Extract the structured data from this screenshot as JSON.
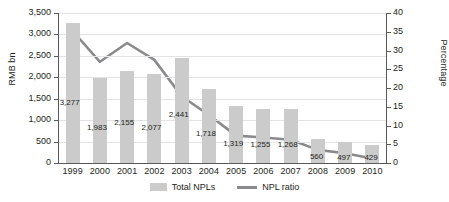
{
  "chart_data": {
    "type": "bar",
    "title": "",
    "categories": [
      "1999",
      "2000",
      "2001",
      "2002",
      "2003",
      "2004",
      "2005",
      "2006",
      "2007",
      "2008",
      "2009",
      "2010"
    ],
    "xlabel": "",
    "ylabel": "RMB bn",
    "ylabel_secondary": "Percentage",
    "ylim": [
      0,
      3500
    ],
    "ylim_secondary": [
      0,
      40
    ],
    "yticks": [
      "0",
      "500",
      "1,000",
      "1,500",
      "2,000",
      "2,500",
      "3,000",
      "3,500"
    ],
    "ytick_values": [
      0,
      500,
      1000,
      1500,
      2000,
      2500,
      3000,
      3500
    ],
    "yticks_secondary": [
      "0",
      "5",
      "10",
      "15",
      "20",
      "25",
      "30",
      "35",
      "40"
    ],
    "ytick_values_secondary": [
      0,
      5,
      10,
      15,
      20,
      25,
      30,
      35,
      40
    ],
    "grid": true,
    "legend_position": "bottom",
    "series": [
      {
        "name": "Total NPLs",
        "type": "bar",
        "axis": "left",
        "unit": "RMB bn",
        "color": "#cbcbcb",
        "values": [
          3277,
          1983,
          2155,
          2077,
          2441,
          1718,
          1319,
          1255,
          1268,
          560,
          497,
          429
        ],
        "labels": [
          "3,277",
          "1,983",
          "2,155",
          "2,077",
          "2,441",
          "1,718",
          "1,319",
          "1,255",
          "1,268",
          "560",
          "497",
          "429"
        ]
      },
      {
        "name": "NPL ratio",
        "type": "line",
        "axis": "right",
        "unit": "%",
        "color": "#8a8a8d",
        "values": [
          35.2,
          27.0,
          32.0,
          27.5,
          17.8,
          12.8,
          7.3,
          6.8,
          6.2,
          3.5,
          2.6,
          1.2
        ]
      }
    ]
  },
  "legend": {
    "bars_label": "Total NPLs",
    "line_label": "NPL ratio"
  }
}
